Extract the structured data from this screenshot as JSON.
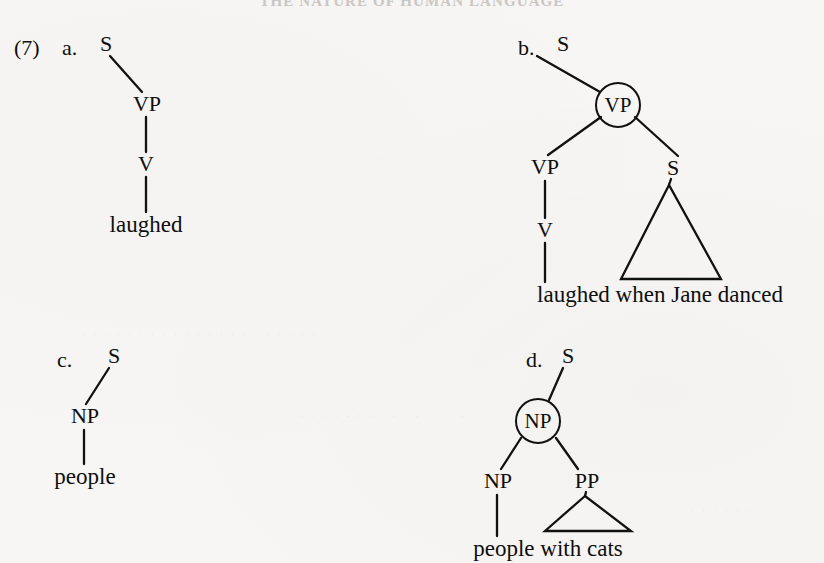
{
  "page": {
    "running_header": "THE NATURE OF HUMAN LANGUAGE",
    "background_color": "#f7f6f4",
    "ink_color": "#111111",
    "width": 824,
    "height": 563
  },
  "example": {
    "number": "(7)"
  },
  "trees": [
    {
      "id": "a",
      "letter": "a.",
      "description": "non-recursive VP dominating V dominating 'laughed'",
      "nodes": [
        {
          "label": "S",
          "circled": false
        },
        {
          "label": "VP",
          "circled": false
        },
        {
          "label": "V",
          "circled": false
        }
      ],
      "leaves": [
        "laughed"
      ],
      "triangle_leaf": null
    },
    {
      "id": "b",
      "letter": "b.",
      "description": "recursive VP: circled VP dominating VP and S",
      "nodes": [
        {
          "label": "S",
          "circled": false
        },
        {
          "label": "VP",
          "circled": true
        },
        {
          "label": "VP",
          "circled": false
        },
        {
          "label": "S",
          "circled": false
        },
        {
          "label": "V",
          "circled": false
        }
      ],
      "leaves": [
        "laughed when Jane danced"
      ],
      "triangle_leaf": "when Jane danced"
    },
    {
      "id": "c",
      "letter": "c.",
      "description": "non-recursive NP dominating 'people'",
      "nodes": [
        {
          "label": "S",
          "circled": false
        },
        {
          "label": "NP",
          "circled": false
        }
      ],
      "leaves": [
        "people"
      ],
      "triangle_leaf": null
    },
    {
      "id": "d",
      "letter": "d.",
      "description": "recursive NP: circled NP dominating NP and PP",
      "nodes": [
        {
          "label": "S",
          "circled": false
        },
        {
          "label": "NP",
          "circled": true
        },
        {
          "label": "NP",
          "circled": false
        },
        {
          "label": "PP",
          "circled": false
        }
      ],
      "leaves": [
        "people with cats"
      ],
      "triangle_leaf": "with cats"
    }
  ],
  "labels": {
    "a_S": "S",
    "a_VP": "VP",
    "a_V": "V",
    "a_leaf": "laughed",
    "b_S_top": "S",
    "b_VP_circled": "VP",
    "b_VP": "VP",
    "b_S": "S",
    "b_V": "V",
    "b_leaf": "laughed when Jane danced",
    "c_S": "S",
    "c_NP": "NP",
    "c_leaf": "people",
    "d_S": "S",
    "d_NP_circled": "NP",
    "d_NP": "NP",
    "d_PP": "PP",
    "d_leaf": "people with cats",
    "letter_a": "a.",
    "letter_b": "b.",
    "letter_c": "c.",
    "letter_d": "d."
  }
}
